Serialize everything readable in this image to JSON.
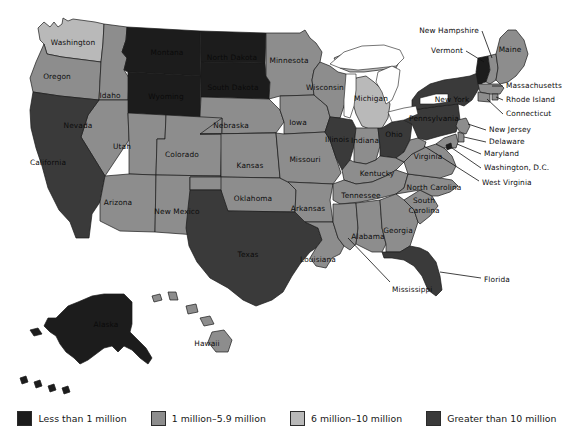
{
  "figure": {
    "background_color": "#ffffff"
  },
  "legend": {
    "items": [
      {
        "label": "Less than 1 million",
        "color": "#1c1c1c",
        "key": "lt1m"
      },
      {
        "label": "1 million–5.9 million",
        "color": "#8d8d8d",
        "key": "1to59m"
      },
      {
        "label": "6 million–10 million",
        "color": "#b9b9b9",
        "key": "6to10m"
      },
      {
        "label": "Greater than 10 million",
        "color": "#3a3a3a",
        "key": "gt10m"
      }
    ]
  },
  "map": {
    "colors": {
      "lt1m": "#1c1c1c",
      "1to59m": "#8d8d8d",
      "6to10m": "#b9b9b9",
      "gt10m": "#3a3a3a",
      "border": "#1a1a1a",
      "water": "#ffffff"
    },
    "states": [
      {
        "code": "WA",
        "label": "Washington",
        "category": "6to10m",
        "label_x": 73,
        "label_y": 43,
        "label_inside": true
      },
      {
        "code": "OR",
        "label": "Oregon",
        "category": "1to59m",
        "label_x": 57,
        "label_y": 77,
        "label_inside": true
      },
      {
        "code": "ID",
        "label": "Idaho",
        "category": "1to59m",
        "label_x": 110,
        "label_y": 96,
        "label_inside": true
      },
      {
        "code": "MT",
        "label": "Montana",
        "category": "lt1m",
        "label_x": 167,
        "label_y": 53,
        "label_inside": true
      },
      {
        "code": "ND",
        "label": "North Dakota",
        "category": "lt1m",
        "label_x": 232,
        "label_y": 58,
        "label_inside": true
      },
      {
        "code": "SD",
        "label": "South Dakota",
        "category": "lt1m",
        "label_x": 233,
        "label_y": 88,
        "label_inside": true
      },
      {
        "code": "WY",
        "label": "Wyoming",
        "category": "lt1m",
        "label_x": 166,
        "label_y": 97,
        "label_inside": true
      },
      {
        "code": "NV",
        "label": "Nevada",
        "category": "1to59m",
        "label_x": 78,
        "label_y": 126,
        "label_inside": true
      },
      {
        "code": "UT",
        "label": "Utah",
        "category": "1to59m",
        "label_x": 122,
        "label_y": 147,
        "label_inside": true
      },
      {
        "code": "CA",
        "label": "California",
        "category": "gt10m",
        "label_x": 48,
        "label_y": 163,
        "label_inside": true
      },
      {
        "code": "AZ",
        "label": "Arizona",
        "category": "1to59m",
        "label_x": 118,
        "label_y": 203,
        "label_inside": true
      },
      {
        "code": "CO",
        "label": "Colorado",
        "category": "1to59m",
        "label_x": 182,
        "label_y": 155,
        "label_inside": true
      },
      {
        "code": "NM",
        "label": "New Mexico",
        "category": "1to59m",
        "label_x": 177,
        "label_y": 212,
        "label_inside": true
      },
      {
        "code": "NE",
        "label": "Nebraska",
        "category": "1to59m",
        "label_x": 231,
        "label_y": 126,
        "label_inside": true
      },
      {
        "code": "KS",
        "label": "Kansas",
        "category": "1to59m",
        "label_x": 250,
        "label_y": 166,
        "label_inside": true
      },
      {
        "code": "OK",
        "label": "Oklahoma",
        "category": "1to59m",
        "label_x": 253,
        "label_y": 199,
        "label_inside": true
      },
      {
        "code": "TX",
        "label": "Texas",
        "category": "gt10m",
        "label_x": 248,
        "label_y": 255,
        "label_inside": true
      },
      {
        "code": "MN",
        "label": "Minnesota",
        "category": "1to59m",
        "label_x": 289,
        "label_y": 61,
        "label_inside": true
      },
      {
        "code": "IA",
        "label": "Iowa",
        "category": "1to59m",
        "label_x": 298,
        "label_y": 123,
        "label_inside": true
      },
      {
        "code": "MO",
        "label": "Missouri",
        "category": "1to59m",
        "label_x": 305,
        "label_y": 160,
        "label_inside": true
      },
      {
        "code": "AR",
        "label": "Arkansas",
        "category": "1to59m",
        "label_x": 308,
        "label_y": 209,
        "label_inside": true
      },
      {
        "code": "LA",
        "label": "Louisiana",
        "category": "1to59m",
        "label_x": 318,
        "label_y": 260,
        "label_inside": true
      },
      {
        "code": "WI",
        "label": "Wisconsin",
        "category": "1to59m",
        "label_x": 325,
        "label_y": 88,
        "label_inside": true
      },
      {
        "code": "MI",
        "label": "Michigan",
        "category": "6to10m",
        "label_x": 371,
        "label_y": 99,
        "label_inside": true
      },
      {
        "code": "IL",
        "label": "Illinois",
        "category": "gt10m",
        "label_x": 337,
        "label_y": 140,
        "label_inside": true
      },
      {
        "code": "IN",
        "label": "Indiana",
        "category": "1to59m",
        "label_x": 365,
        "label_y": 141,
        "label_inside": true
      },
      {
        "code": "OH",
        "label": "Ohio",
        "category": "gt10m",
        "label_x": 394,
        "label_y": 135,
        "label_inside": true
      },
      {
        "code": "KY",
        "label": "Kentucky",
        "category": "1to59m",
        "label_x": 377,
        "label_y": 174,
        "label_inside": true
      },
      {
        "code": "TN",
        "label": "Tennessee",
        "category": "1to59m",
        "label_x": 361,
        "label_y": 196,
        "label_inside": true
      },
      {
        "code": "MS",
        "label": "Mississippi",
        "category": "1to59m",
        "label_x": 360,
        "label_y": 290,
        "label_inside": false,
        "leader": [
          [
            390,
            284
          ],
          [
            336,
            249
          ]
        ]
      },
      {
        "code": "AL",
        "label": "Alabama",
        "category": "1to59m",
        "label_x": 368,
        "label_y": 237,
        "label_inside": true
      },
      {
        "code": "GA",
        "label": "Georgia",
        "category": "1to59m",
        "label_x": 398,
        "label_y": 231,
        "label_inside": true
      },
      {
        "code": "FL",
        "label": "Florida",
        "category": "gt10m",
        "label_x": 484,
        "label_y": 280,
        "label_inside": false,
        "leader": [
          [
            481,
            280
          ],
          [
            442,
            275
          ]
        ]
      },
      {
        "code": "SC",
        "label": "South Carolina",
        "category": "1to59m",
        "label_x": 414,
        "label_y": 205,
        "label_inside": true
      },
      {
        "code": "NC",
        "label": "North Carolina",
        "category": "1to59m",
        "label_x": 434,
        "label_y": 188,
        "label_inside": true
      },
      {
        "code": "VA",
        "label": "Virginia",
        "category": "1to59m",
        "label_x": 428,
        "label_y": 157,
        "label_inside": true
      },
      {
        "code": "WV",
        "label": "West Virginia",
        "category": "1to59m",
        "label_x": 482,
        "label_y": 183,
        "label_inside": false,
        "leader": [
          [
            479,
            183
          ],
          [
            421,
            150
          ]
        ]
      },
      {
        "code": "PA",
        "label": "Pennsylvania",
        "category": "gt10m",
        "label_x": 434,
        "label_y": 119,
        "label_inside": true
      },
      {
        "code": "NY",
        "label": "New York",
        "category": "gt10m",
        "label_x": 452,
        "label_y": 100,
        "label_inside": true
      },
      {
        "code": "ME",
        "label": "Maine",
        "category": "1to59m",
        "label_x": 508,
        "label_y": 50,
        "label_inside": true
      },
      {
        "code": "NH",
        "label": "New Hampshire",
        "category": "1to59m",
        "label_x": 427,
        "label_y": 33,
        "label_inside": false,
        "leader": [
          [
            482,
            33
          ],
          [
            492,
            58
          ]
        ]
      },
      {
        "code": "VT",
        "label": "Vermont",
        "category": "lt1m",
        "label_x": 430,
        "label_y": 53,
        "label_inside": false,
        "leader": [
          [
            466,
            53
          ],
          [
            486,
            62
          ]
        ]
      },
      {
        "code": "MA",
        "label": "Massachusetts",
        "category": "1to59m",
        "label_x": 506,
        "label_y": 88,
        "label_inside": false,
        "leader": [
          [
            503,
            88
          ],
          [
            490,
            84
          ]
        ]
      },
      {
        "code": "RI",
        "label": "Rhode Island",
        "category": "1to59m",
        "label_x": 506,
        "label_y": 102,
        "label_inside": false,
        "leader": [
          [
            503,
            102
          ],
          [
            490,
            93
          ]
        ]
      },
      {
        "code": "CT",
        "label": "Connecticut",
        "category": "1to59m",
        "label_x": 506,
        "label_y": 116,
        "label_inside": false,
        "leader": [
          [
            503,
            116
          ],
          [
            483,
            97
          ]
        ]
      },
      {
        "code": "NJ",
        "label": "New Jersey",
        "category": "1to59m",
        "label_x": 489,
        "label_y": 132,
        "label_inside": false,
        "leader": [
          [
            486,
            132
          ],
          [
            464,
            122
          ]
        ]
      },
      {
        "code": "DE",
        "label": "Delaware",
        "category": "1to59m",
        "label_x": 489,
        "label_y": 144,
        "label_inside": false,
        "leader": [
          [
            486,
            144
          ],
          [
            461,
            136
          ]
        ]
      },
      {
        "code": "MD",
        "label": "Maryland",
        "category": "1to59m",
        "label_x": 484,
        "label_y": 156,
        "label_inside": false,
        "leader": [
          [
            481,
            156
          ],
          [
            455,
            142
          ]
        ]
      },
      {
        "code": "DC",
        "label": "Washington, D.C.",
        "category": "lt1m",
        "label_x": 484,
        "label_y": 170,
        "label_inside": false,
        "leader": [
          [
            481,
            170
          ],
          [
            450,
            148
          ]
        ]
      },
      {
        "code": "AK",
        "label": "Alaska",
        "category": "lt1m",
        "label_x": 106,
        "label_y": 325,
        "label_inside": true
      },
      {
        "code": "HI",
        "label": "Hawaii",
        "category": "1to59m",
        "label_x": 207,
        "label_y": 344,
        "label_inside": true
      }
    ]
  }
}
